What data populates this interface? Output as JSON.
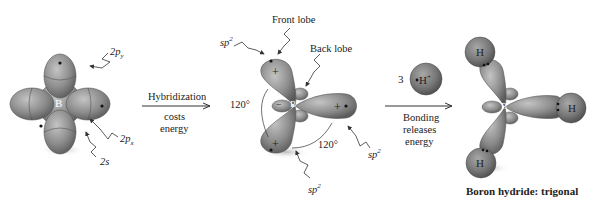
{
  "boron_atom": {
    "center_label": "B",
    "labels": {
      "p_y": "2p",
      "p_y_sub": "y",
      "p_x": "2p",
      "p_x_sub": "x",
      "s": "2s"
    }
  },
  "step1": {
    "above_arrow": "Hybridization",
    "below_arrow_line1": "costs",
    "below_arrow_line2": "energy"
  },
  "hybrid": {
    "center_label": "B",
    "front_lobe": "Front lobe",
    "back_lobe": "Back lobe",
    "sp2_label": "sp",
    "sp2_sup": "2",
    "angle_left": "120°",
    "angle_bottom": "120°",
    "plus": "+",
    "minus": "−"
  },
  "step2": {
    "reagent_count": "3",
    "reagent": "H",
    "reagent_sup": "+",
    "below_arrow_line1": "Bonding",
    "below_arrow_line2": "releases",
    "below_arrow_line3": "energy"
  },
  "product": {
    "center_label": "B",
    "h_label": "H",
    "caption": "Boron hydride: trigonal"
  },
  "colors": {
    "orbital": "#8a8a8a",
    "orbital_dark": "#5e5e5e",
    "orbital_light": "#b5b5b5",
    "line": "#333333"
  }
}
